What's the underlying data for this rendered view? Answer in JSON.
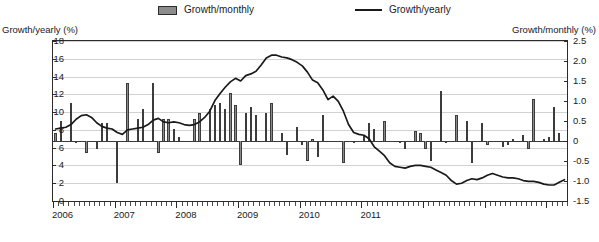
{
  "legend": {
    "entries": [
      {
        "label": "Growth/monthly",
        "marker": "bar-swatch"
      },
      {
        "label": "Growth/yearly",
        "marker": "line-swatch"
      }
    ]
  },
  "axes": {
    "left_title": "Growth/yearly (%)",
    "right_title": "Growth/monthly (%)",
    "left_ticks": [
      "18",
      "16",
      "14",
      "12",
      "10",
      "8",
      "6",
      "4",
      "2",
      "0"
    ],
    "right_ticks": [
      "2.5",
      "2.0",
      "1.5",
      "1.0",
      "0.5",
      "0",
      "-0.5",
      "-1.0",
      "-1.5"
    ],
    "x_ticks": [
      "2006",
      "2007",
      "2008",
      "2009",
      "2010",
      "2011"
    ]
  },
  "chart_data": {
    "type": "bar",
    "title": "",
    "xlabel": "",
    "ylabel": "Growth/yearly (%)",
    "y2label": "Growth/monthly (%)",
    "ylim": [
      0,
      18
    ],
    "y2lim": [
      -1.5,
      2.5
    ],
    "grid": true,
    "legend_position": "top",
    "x_start": "2006-01",
    "x_tick_labels": [
      "2006",
      "2007",
      "2008",
      "2009",
      "2010",
      "2011"
    ],
    "x_tick_interval_months": 12,
    "series": [
      {
        "name": "Growth/monthly",
        "type": "bar",
        "axis": "right",
        "unit": "%",
        "values": [
          0.2,
          0.5,
          0.0,
          0.95,
          -0.05,
          0.0,
          -0.3,
          0.0,
          -0.2,
          0.45,
          0.45,
          -0.02,
          -1.05,
          0.0,
          1.45,
          0.0,
          0.55,
          0.8,
          0.0,
          1.45,
          -0.3,
          0.55,
          0.55,
          0.3,
          0.1,
          0.0,
          0.0,
          0.55,
          0.7,
          0.0,
          0.8,
          0.9,
          0.95,
          0.8,
          1.2,
          0.9,
          -0.6,
          0.7,
          0.85,
          0.65,
          0.0,
          0.7,
          0.95,
          0.0,
          0.2,
          -0.35,
          0.0,
          0.35,
          -0.1,
          -0.5,
          0.05,
          -0.4,
          0.65,
          0.0,
          0.0,
          -0.02,
          -0.55,
          0.0,
          -0.05,
          0.0,
          0.15,
          0.45,
          0.3,
          0.0,
          0.5,
          -0.02,
          0.0,
          -0.05,
          -0.2,
          0.0,
          0.25,
          0.2,
          -0.2,
          -0.5,
          0.0,
          1.25,
          -0.05,
          0.0,
          0.65,
          0.0,
          0.5,
          -0.55,
          0.0,
          0.45,
          -0.1,
          0.0,
          0.0,
          -0.15,
          -0.1,
          0.05,
          0.0,
          0.15,
          -0.2,
          1.05,
          0.0,
          0.05,
          0.1,
          0.85,
          0.2,
          0.0
        ]
      },
      {
        "name": "Growth/yearly",
        "type": "line",
        "axis": "left",
        "unit": "%",
        "values": [
          8.1,
          8.2,
          8.3,
          8.6,
          9.2,
          9.6,
          9.7,
          9.4,
          8.8,
          8.4,
          8.2,
          8.1,
          7.7,
          7.5,
          8.0,
          8.1,
          8.2,
          8.3,
          8.6,
          9.1,
          9.3,
          8.9,
          8.8,
          8.9,
          8.8,
          8.6,
          8.5,
          8.6,
          8.9,
          9.4,
          10.1,
          11.3,
          12.1,
          12.8,
          13.4,
          13.8,
          13.5,
          14.1,
          14.3,
          14.6,
          15.3,
          16.1,
          16.4,
          16.4,
          16.2,
          16.1,
          15.9,
          15.6,
          15.2,
          14.5,
          13.6,
          13.3,
          12.5,
          11.4,
          11.8,
          11.2,
          10.1,
          8.6,
          7.7,
          7.5,
          7.4,
          7.0,
          6.1,
          5.6,
          5.1,
          4.3,
          3.9,
          3.8,
          3.7,
          3.9,
          4.0,
          4.0,
          3.9,
          3.8,
          3.5,
          3.2,
          2.9,
          2.3,
          1.9,
          2.0,
          2.3,
          2.5,
          2.4,
          2.6,
          2.9,
          3.1,
          2.9,
          2.7,
          2.6,
          2.6,
          2.5,
          2.3,
          2.2,
          2.2,
          2.1,
          1.9,
          1.8,
          1.8,
          2.1,
          2.4
        ]
      }
    ]
  },
  "colors": {
    "bar_fill": "#8a8a8a",
    "bar_edge": "#3c3c3c",
    "line": "#1a1a1a",
    "grid": "#d2d2d2",
    "frame": "#2b2b2b"
  }
}
